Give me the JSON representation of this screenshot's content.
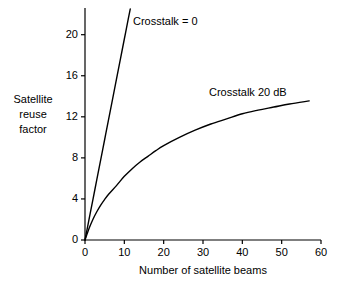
{
  "figure": {
    "background_color": "#ffffff",
    "line_color": "#000000",
    "axis_color": "#000000"
  },
  "chart_data": {
    "type": "line",
    "title": "",
    "xlabel": "Number of satellite beams",
    "ylabel": "Satellite reuse factor",
    "ylabel_lines": [
      "Satellite",
      "reuse",
      "factor"
    ],
    "xlim": [
      0,
      60
    ],
    "ylim": [
      0,
      22.6
    ],
    "xticks": [
      0,
      10,
      20,
      30,
      40,
      50,
      60
    ],
    "xtick_labels": [
      "0",
      "10",
      "20",
      "30",
      "40",
      "50",
      "60"
    ],
    "yticks": [
      0,
      4,
      8,
      12,
      16,
      20
    ],
    "ytick_labels": [
      "0",
      "4",
      "8",
      "12",
      "16",
      "20"
    ],
    "grid": false,
    "legend": "inline-annotations",
    "series": [
      {
        "name": "Crosstalk = 0",
        "annotation": "Crosstalk = 0",
        "x": [
          0,
          1,
          2,
          3,
          4,
          5,
          6,
          7,
          8,
          9,
          10,
          11,
          11.5
        ],
        "values": [
          0,
          1.96,
          3.92,
          5.87,
          7.83,
          9.79,
          11.75,
          13.7,
          15.66,
          17.62,
          19.58,
          21.53,
          22.5
        ]
      },
      {
        "name": "Crosstalk 20 dB",
        "annotation": "Crosstalk 20 dB",
        "x": [
          0,
          1,
          2,
          3,
          4,
          5,
          6,
          8,
          10,
          12,
          14,
          16,
          18,
          20,
          24,
          28,
          32,
          36,
          40,
          44,
          48,
          52,
          57
        ],
        "values": [
          0,
          1.1,
          2.0,
          2.75,
          3.4,
          3.95,
          4.45,
          5.3,
          6.2,
          6.95,
          7.6,
          8.15,
          8.7,
          9.2,
          10.0,
          10.7,
          11.3,
          11.8,
          12.3,
          12.65,
          12.95,
          13.25,
          13.55
        ]
      }
    ]
  },
  "annotations": {
    "crosstalk_zero": "Crosstalk = 0",
    "crosstalk_twenty_db": "Crosstalk 20 dB"
  }
}
